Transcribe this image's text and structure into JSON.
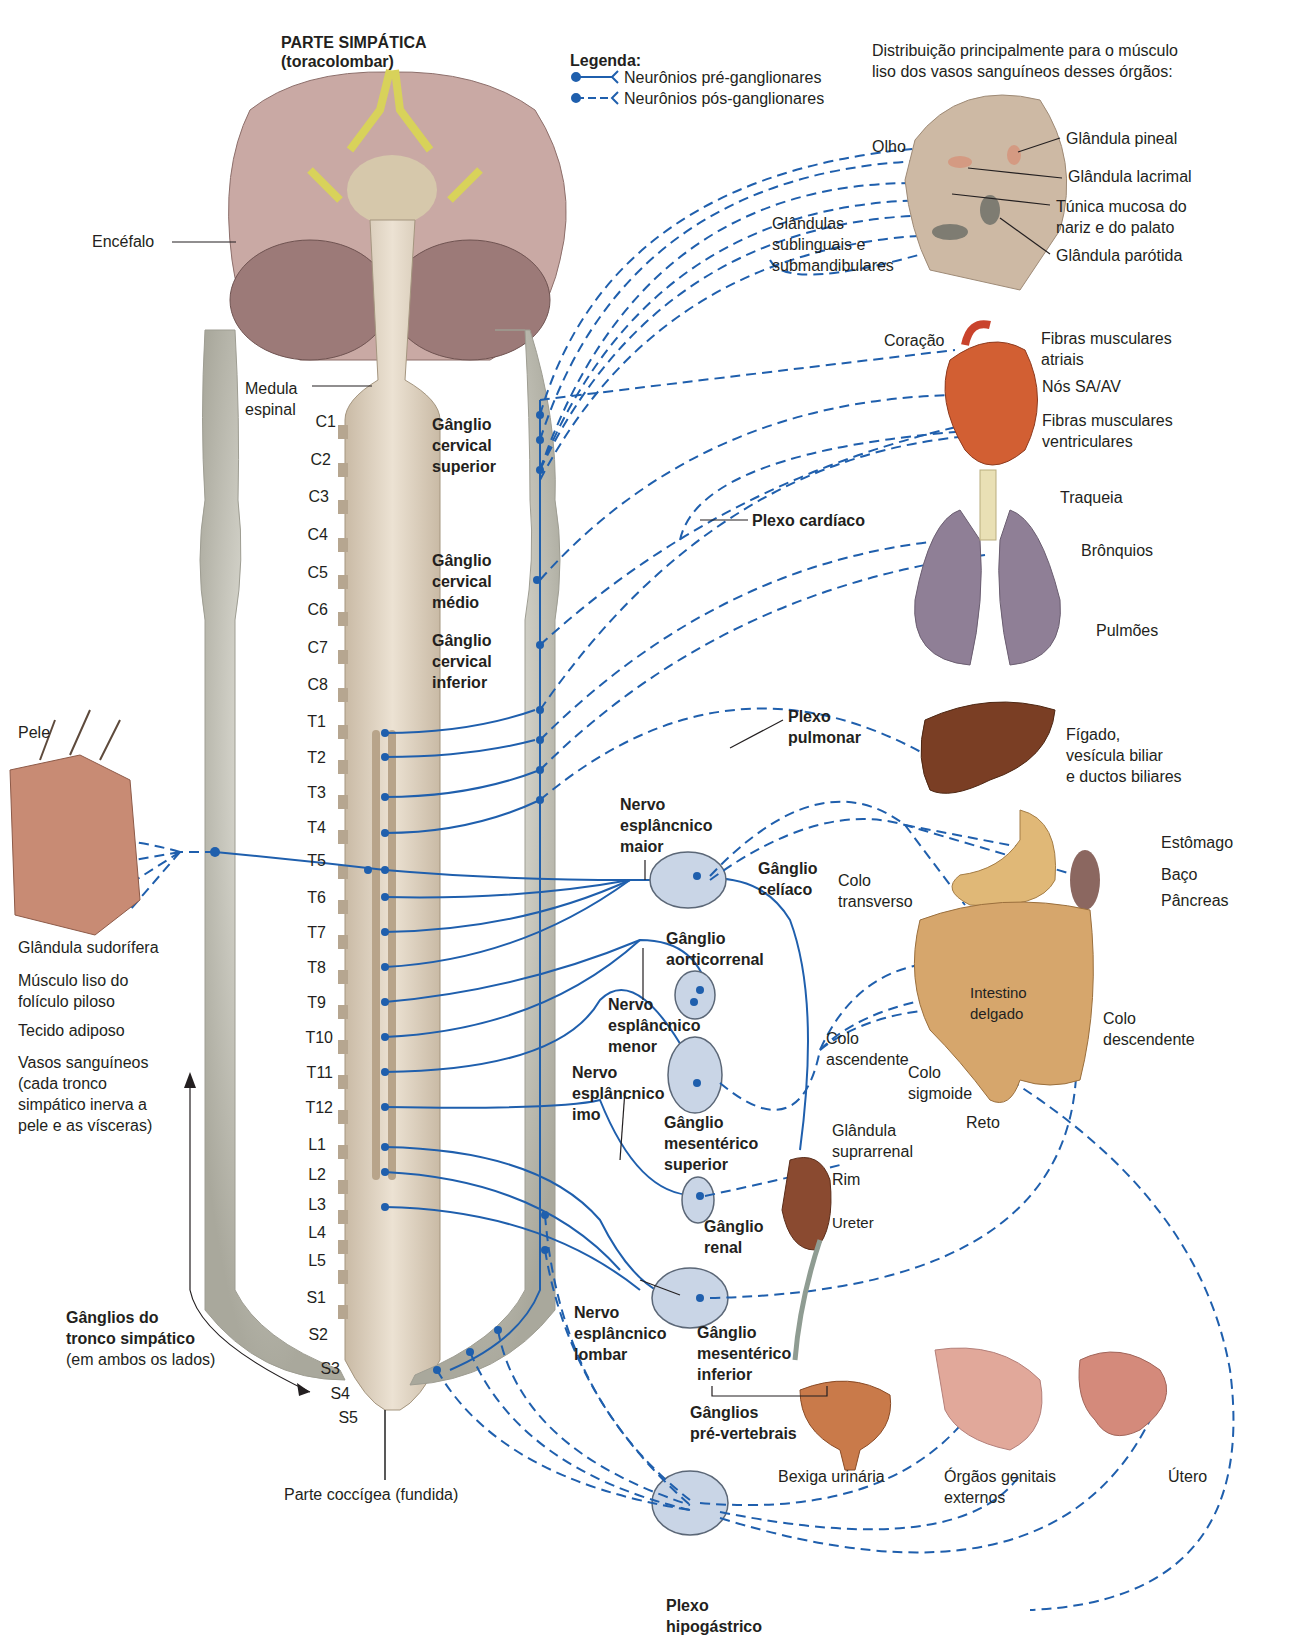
{
  "header": {
    "cropped_caption_fragment": "",
    "title": "PARTE SIMPÁTICA",
    "subtitle": "(toracolombar)"
  },
  "legend": {
    "title": "Legenda:",
    "items": [
      {
        "style": "solid",
        "label": "Neurônios pré-ganglionares"
      },
      {
        "style": "dashed",
        "label": "Neurônios pós-ganglionares"
      }
    ]
  },
  "distribution_note": "Distribuição principalmente para o músculo\nliso dos vasos sanguíneos desses órgãos:",
  "colors": {
    "nerve_blue": "#1f5fad",
    "ganglion_fill": "#c9d5e6",
    "chain_gray": "#c8c7bd",
    "cord_beige": "#d9cbb8",
    "brain_pink": "#b79a95"
  },
  "cns": {
    "brain_label": "Encéfalo",
    "cord_label": "Medula\nespinal",
    "coccygeal_label": "Parte coccígea (fundida)",
    "segments": [
      "C1",
      "C2",
      "C3",
      "C4",
      "C5",
      "C6",
      "C7",
      "C8",
      "T1",
      "T2",
      "T3",
      "T4",
      "T5",
      "T6",
      "T7",
      "T8",
      "T9",
      "T10",
      "T11",
      "T12",
      "L1",
      "L2",
      "L3",
      "L4",
      "L5",
      "S1",
      "S2",
      "S3",
      "S4",
      "S5"
    ]
  },
  "ganglia": {
    "cervical_superior": "Gânglio\ncervical\nsuperior",
    "cervical_medio": "Gânglio\ncervical\nmédio",
    "cervical_inferior": "Gânglio\ncervical\ninferior",
    "celiaco": "Gânglio\ncelíaco",
    "aorticorrenal": "Gânglio\naorticorrenal",
    "mesenterico_superior": "Gânglio\nmesentérico\nsuperior",
    "renal": "Gânglio\nrenal",
    "mesenterico_inferior": "Gânglio\nmesentérico\ninferior",
    "pre_vertebrais": "Gânglios\npré-vertebrais",
    "tronco_simpatico": "Gânglios do\ntronco simpático",
    "tronco_simpatico_note": "(em ambos os lados)"
  },
  "nerves": {
    "esplancnico_maior": "Nervo\nesplâncnico\nmaior",
    "esplancnico_menor": "Nervo\nesplâncnico\nmenor",
    "esplancnico_imo": "Nervo\nesplâncnico\nimo",
    "esplancnico_lombar": "Nervo\nesplâncnico\nlombar"
  },
  "plexuses": {
    "cardiaco": "Plexo cardíaco",
    "pulmonar": "Plexo\npulmonar",
    "hipogastrico": "Plexo\nhipogástrico"
  },
  "skin": {
    "title": "Pele",
    "items": [
      "Glândula sudorífera",
      "Músculo liso do\nfolículo piloso",
      "Tecido adiposo",
      "Vasos sanguíneos\n(cada tronco\nsimpático inerva a\npele e as vísceras)"
    ]
  },
  "head": {
    "olho": "Olho",
    "pineal": "Glândula pineal",
    "lacrimal": "Glândula lacrimal",
    "mucosa": "Túnica mucosa do\nnariz e do palato",
    "sublinguais": "Glândulas\nsublinguais e\nsubmandibulares",
    "parotida": "Glândula parótida"
  },
  "heart": {
    "label": "Coração",
    "atriais": "Fibras musculares\natriais",
    "nos": "Nós SA/AV",
    "ventriculares": "Fibras musculares\nventriculares"
  },
  "lungs": {
    "traqueia": "Traqueia",
    "bronquios": "Brônquios",
    "pulmoes": "Pulmões"
  },
  "liver": {
    "label": "Fígado,\nvesícula biliar\ne ductos biliares"
  },
  "abdomen": {
    "estomago": "Estômago",
    "baco": "Baço",
    "pancreas": "Pâncreas",
    "colo_transverso": "Colo\ntransverso",
    "intestino": "Intestino\ndelgado",
    "colo_ascendente": "Colo\nascendente",
    "colo_descendente": "Colo\ndescendente",
    "colo_sigmoide": "Colo\nsigmoide",
    "reto": "Reto",
    "suprarrenal": "Glândula\nsuprarrenal",
    "rim": "Rim",
    "ureter": "Ureter"
  },
  "pelvis": {
    "bexiga": "Bexiga urinária",
    "genitais": "Órgãos genitais\nexternos",
    "utero": "Útero"
  }
}
